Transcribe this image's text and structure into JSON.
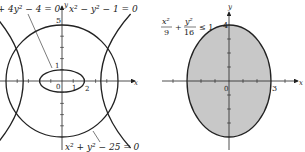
{
  "left_figure": {
    "axes": {
      "x_label": "x",
      "y_label": "y"
    },
    "tick_labels": {
      "origin": "0",
      "x1": "1",
      "x2": "2",
      "y1": "1",
      "y5": "5"
    },
    "curves": [
      {
        "name": "circle",
        "equation": "x² + y² − 25 = 0"
      },
      {
        "name": "ellipse",
        "equation": "x² + 4y² − 4 = 0"
      },
      {
        "name": "hyperbola",
        "equation": "x² − y² − 1 = 0"
      }
    ],
    "labels": {
      "ellipse_eq": "x² + 4y² − 4 = 0",
      "hyperbola_eq": "x² − y² − 1 = 0",
      "circle_eq": "x² + y² − 25 = 0"
    }
  },
  "right_figure": {
    "axes": {
      "x_label": "x",
      "y_label": "y"
    },
    "tick_labels": {
      "origin": "0",
      "x3": "3",
      "y4": "4"
    },
    "region": {
      "inequality": "x²/9 + y²/16 ≤ 1",
      "fill": "#c8c8c8"
    },
    "labels": {
      "inequality_num1": "x²",
      "inequality_den1": "9",
      "inequality_num2": "y²",
      "inequality_den2": "16",
      "inequality_rel": "≤ 1",
      "plus": "+"
    }
  },
  "colors": {
    "stroke": "#222222",
    "region_fill": "#c8c8c8",
    "background": "#ffffff"
  }
}
